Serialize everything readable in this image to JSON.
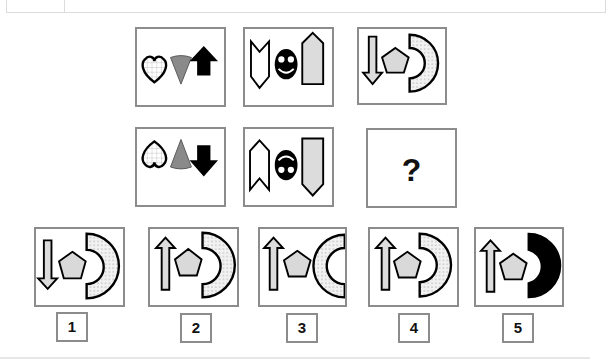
{
  "header": {
    "text": ""
  },
  "puzzle": {
    "question_mark": "?",
    "rows": [
      {
        "cells": [
          {
            "shapes": [
              "heart-grid-outline",
              "gray-cone-down",
              "black-arrow-up"
            ]
          },
          {
            "shapes": [
              "white-chevron-banner-down",
              "black-smiley-face",
              "gray-arrow-pentagon-up"
            ]
          },
          {
            "shapes": [
              "gray-arrow-down",
              "gray-pentagon",
              "dotted-half-ring"
            ]
          }
        ]
      },
      {
        "cells": [
          {
            "shapes": [
              "heart-grid-outline-inverted",
              "gray-cone-up",
              "black-arrow-down"
            ]
          },
          {
            "shapes": [
              "white-chevron-banner-up",
              "black-face-inverted",
              "gray-arrow-pentagon-down"
            ]
          },
          {
            "shapes": [
              "question-mark"
            ]
          }
        ]
      }
    ]
  },
  "options": [
    {
      "label": "1",
      "shapes": [
        "gray-arrow-down",
        "gray-pentagon",
        "dotted-half-ring"
      ]
    },
    {
      "label": "2",
      "shapes": [
        "gray-arrow-up",
        "gray-pentagon",
        "dotted-half-ring"
      ]
    },
    {
      "label": "3",
      "shapes": [
        "gray-arrow-up",
        "gray-pentagon",
        "dotted-ring-open-right"
      ]
    },
    {
      "label": "4",
      "shapes": [
        "gray-arrow-up",
        "gray-pentagon",
        "dotted-half-ring"
      ]
    },
    {
      "label": "5",
      "shapes": [
        "gray-arrow-up",
        "gray-pentagon",
        "black-half-ring"
      ]
    }
  ],
  "colors": {
    "border": "#8c8c8c",
    "fill_gray": "#d9d9d9",
    "cone_gray": "#8a8a8a",
    "black": "#000000"
  }
}
